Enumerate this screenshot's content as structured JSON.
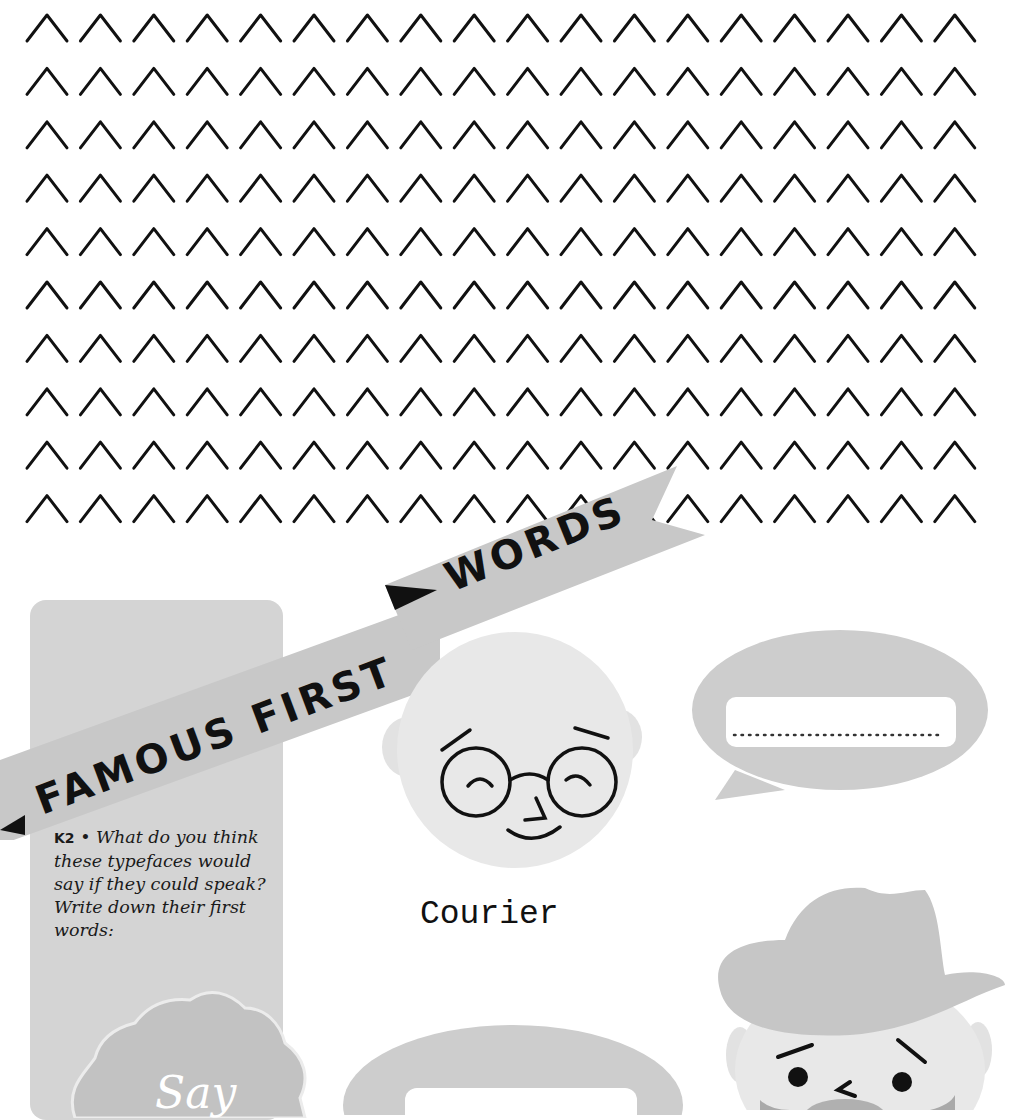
{
  "worksheet": {
    "pattern": {
      "glyph": "chevron-up",
      "rows": 10,
      "columns": 18
    },
    "banner": {
      "line1": "FAMOUS FIRST",
      "line2": "WORDS"
    },
    "instructions": {
      "code": "K2",
      "bullet": "•",
      "text": "What do you think these typefaces would say if they could speak? Write down their first words:"
    },
    "badge": {
      "text": "Say"
    },
    "characters": [
      {
        "name": "Courier",
        "description": "bald man with round glasses"
      },
      {
        "name": "",
        "description": "man with cowboy hat and beard"
      }
    ],
    "speech_bubbles": [
      {
        "value": "",
        "placeholder": "........................."
      },
      {
        "value": "",
        "placeholder": ""
      }
    ],
    "colors": {
      "card": "#d4d4d4",
      "banner": "#c8c8c8",
      "face": "#e8e8e8",
      "hat": "#c6c6c6",
      "bubble": "#cdcdcd",
      "ink": "#111111"
    }
  }
}
